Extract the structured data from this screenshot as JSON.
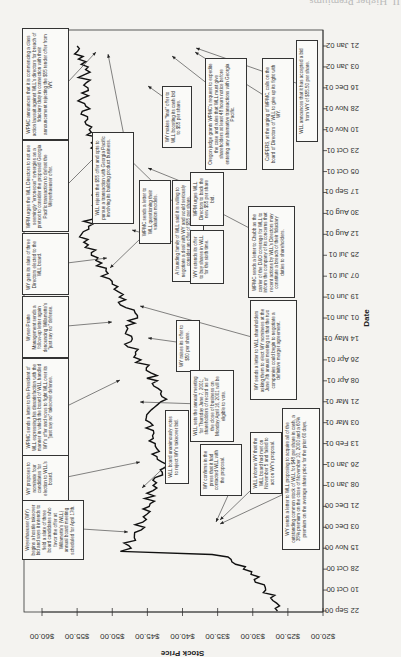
{
  "page_header": "II. Higher Premiums",
  "chart_data": {
    "type": "line",
    "orientation": "rotated-90-clockwise",
    "title": "",
    "xlabel": "Date",
    "ylabel": "Stock Price",
    "ylim": [
      20,
      60
    ],
    "yticks": [
      "$20.00",
      "$25.00",
      "$30.00",
      "$35.00",
      "$40.00",
      "$45.00",
      "$50.00",
      "$55.00",
      "$60.00"
    ],
    "xticks": [
      "22 Sep 00",
      "10 Oct 00",
      "28 Oct 00",
      "15 Nov 00",
      "03 Dec 00",
      "21 Dec 00",
      "08 Jan 01",
      "26 Jan 01",
      "13 Feb 01",
      "03 Mar 01",
      "21 Mar 01",
      "08 Apr 01",
      "26 Apr 01",
      "14 May 01",
      "01 Jun 01",
      "19 Jun 01",
      "07 Jul 01",
      "25 Jul 01",
      "12 Aug 01",
      "30 Aug 01",
      "17 Sep 01",
      "05 Oct 01",
      "23 Oct 01",
      "10 Nov 01",
      "28 Nov 01",
      "16 Dec 01",
      "03 Jan 02",
      "21 Jan 02"
    ],
    "series": [
      {
        "name": "WLL stock price",
        "x": [
          "22 Sep 00",
          "10 Oct 00",
          "28 Oct 00",
          "10 Nov 00",
          "15 Nov 00",
          "03 Dec 00",
          "21 Dec 00",
          "08 Jan 01",
          "26 Jan 01",
          "13 Feb 01",
          "03 Mar 01",
          "21 Mar 01",
          "08 Apr 01",
          "26 Apr 01",
          "14 May 01",
          "01 Jun 01",
          "19 Jun 01",
          "07 Jul 01",
          "25 Jul 01",
          "12 Aug 01",
          "30 Aug 01",
          "17 Sep 01",
          "05 Oct 01",
          "23 Oct 01",
          "10 Nov 01",
          "28 Nov 01",
          "16 Dec 01",
          "03 Jan 02",
          "21 Jan 02"
        ],
        "values": [
          26.5,
          28,
          31,
          35,
          48,
          46,
          45,
          44,
          43,
          44,
          45,
          43,
          44,
          46,
          48,
          47,
          49,
          51,
          53,
          54,
          53,
          52,
          51,
          52,
          53,
          54,
          54,
          54,
          55
        ]
      }
    ],
    "grid": false,
    "legend": "none",
    "annotations": [
      {
        "id": "a1",
        "text": "Weyerhaeuser (WY) begins a hostile takeover bid and says it intends to field a slate of three board candidates who favor the offer at Willamette's (WLL) annual board meeting scheduled for April 17th."
      },
      {
        "id": "a2",
        "text": "WY proposes to nominate four candidates for election to WLL's board."
      },
      {
        "id": "a3",
        "text": "WPMC sends a letter to the President of WLL expressing his dissatisfaction with the manner in which the board of WLL handled WY's offer and vows to fight WLL over its \"just say no\" takeover defense."
      },
      {
        "id": "a4",
        "text": "Wyser-Pratte Management sends a follow-up letter again denouncing Willamette's \"just say no\" defense."
      },
      {
        "id": "a5",
        "text": "WY gets its slate of three Directors elected to the WLL board."
      },
      {
        "id": "a6",
        "text": "WPM urges the WLL Directors to not use seemingly \"erroneous\" synergies as a pretext to consider the proposed Georgia Pacific transaction to defeat the Weyerhaeuser offer."
      },
      {
        "id": "a7",
        "text": "WPMC announces that it is commencing a class action lawsuit against WLL's directors for breach of fiduciary duty in connection with their announcement rejecting the $55 tender offer from WY."
      },
      {
        "id": "a8",
        "text": "WLL rejects the $55 offer and opts to pursue a transaction with Georgia Pacific involving its building product business."
      },
      {
        "id": "a9",
        "text": "WPMC sends a letter to WLL questioning their valuation models."
      },
      {
        "id": "a10",
        "text": "A founding family of WLL said it is willing to negotiate a deal with WY and would seriously consider an offer of $55 per share."
      },
      {
        "id": "a11",
        "text": "WY makes \"final\" offer to WLL boosting its cash bid to $55 per share."
      },
      {
        "id": "a12",
        "text": "WPM urges WLL Directors to back the new $55 per share bid."
      },
      {
        "id": "a13",
        "text": "WY extends its offer to buy shares in WLL for the sixth time."
      },
      {
        "id": "a14",
        "text": "Oregon judge grants WPMC's request to expedite the case and rules that WLL must give shareholders at least 48 hours notice before entering any alternative transactions with Georgia Pacific."
      },
      {
        "id": "a15",
        "text": "WPMC sends a letter to Chubb as the carrier of the D&O coverage for WLL to inform the company of its concerns that recent actions by WLL's Directors may constitute a breach of their fiduciary duties to shareholders."
      },
      {
        "id": "a16",
        "text": "CalPERS, at the urging of WPMC, calls on the board of Directors of WLL to give up its fight with WY."
      },
      {
        "id": "a17",
        "text": "WLL announces that it has accepted a bid from WY of $55.50 per share."
      },
      {
        "id": "a18",
        "text": "WY raises its offer to $50 per share."
      },
      {
        "id": "a19",
        "text": "WLL sets the annual meeting for Thursday June 7, 2001; shareholders of record as of the close of business on Monday April 16, 2001 will be eligible to vote."
      },
      {
        "id": "a20",
        "text": "WY sends a letter to WLL shareholders asking them to elect WY nominees at the June 7th annual meeting so that the two companies could begin to negotiate a definitive merger agreement."
      },
      {
        "id": "a21",
        "text": "WLL board unanimously votes to reject WY's takeover bid."
      },
      {
        "id": "a22",
        "text": "WY confirms in the press that it had contacted WLL with the proposal."
      },
      {
        "id": "a23",
        "text": "WLL informs WY that the WLL board had met on November 5 and failed to act on WY's proposal."
      },
      {
        "id": "a24",
        "text": "WY sends a letter to WLL proposing to acquire all of the outstanding common stock of WLL for $48 per share in cash, a 38% premium on the close of November 10, 2000 and a 60% premium on the average share price for the prior 60 days."
      }
    ]
  }
}
